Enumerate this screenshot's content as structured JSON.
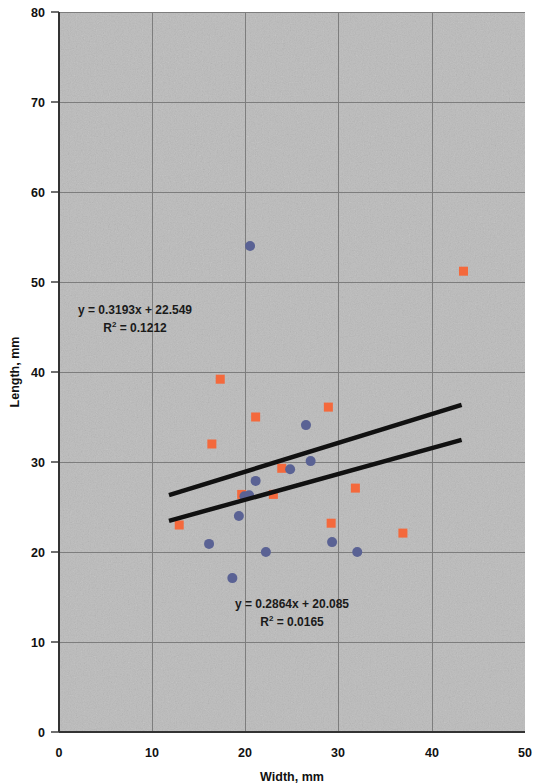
{
  "chart_data": {
    "type": "scatter",
    "title": "",
    "xlabel": "Width, mm",
    "ylabel": "Length, mm",
    "xlim": [
      0,
      50
    ],
    "ylim": [
      0,
      80
    ],
    "xticks": [
      0,
      10,
      20,
      30,
      40,
      50
    ],
    "yticks": [
      0,
      10,
      20,
      30,
      40,
      50,
      60,
      70,
      80
    ],
    "grid": true,
    "legend": "none",
    "plot_background": "#c9c9c9",
    "series": [
      {
        "name": "series-orange-squares",
        "marker": "square",
        "color": "#f4693c",
        "points": [
          {
            "x": 12.9,
            "y": 23.0
          },
          {
            "x": 16.4,
            "y": 32.0
          },
          {
            "x": 17.3,
            "y": 39.2
          },
          {
            "x": 19.6,
            "y": 26.4
          },
          {
            "x": 21.1,
            "y": 35.0
          },
          {
            "x": 23.0,
            "y": 26.4
          },
          {
            "x": 23.9,
            "y": 29.3
          },
          {
            "x": 28.9,
            "y": 36.1
          },
          {
            "x": 29.2,
            "y": 23.2
          },
          {
            "x": 31.8,
            "y": 27.1
          },
          {
            "x": 36.9,
            "y": 22.1
          },
          {
            "x": 43.4,
            "y": 51.2
          }
        ]
      },
      {
        "name": "series-blue-circles",
        "marker": "circle",
        "color": "#5a6294",
        "points": [
          {
            "x": 16.1,
            "y": 20.9
          },
          {
            "x": 18.6,
            "y": 17.1
          },
          {
            "x": 19.3,
            "y": 24.0
          },
          {
            "x": 19.9,
            "y": 26.2
          },
          {
            "x": 20.4,
            "y": 26.3
          },
          {
            "x": 20.5,
            "y": 54.0
          },
          {
            "x": 21.1,
            "y": 27.9
          },
          {
            "x": 22.2,
            "y": 20.0
          },
          {
            "x": 24.8,
            "y": 29.2
          },
          {
            "x": 26.5,
            "y": 34.1
          },
          {
            "x": 27.0,
            "y": 30.1
          },
          {
            "x": 29.3,
            "y": 21.1
          },
          {
            "x": 32.0,
            "y": 20.0
          }
        ]
      }
    ],
    "trendlines": [
      {
        "name": "upper-trendline",
        "slope": 0.3193,
        "intercept": 22.549,
        "r_squared": 0.1212,
        "x_start": 11.8,
        "x_end": 43.2,
        "color": "#111111",
        "equation_text": "y = 0.3193x + 22.549",
        "r2_prefix": "R",
        "r2_exponent": "2",
        "r2_value": " = 0.1212"
      },
      {
        "name": "lower-trendline",
        "slope": 0.2864,
        "intercept": 20.085,
        "r_squared": 0.0165,
        "x_start": 11.8,
        "x_end": 43.2,
        "color": "#111111",
        "equation_text": "y = 0.2864x + 20.085",
        "r2_prefix": "R",
        "r2_exponent": "2",
        "r2_value": " = 0.0165"
      }
    ],
    "annotations": [
      {
        "name": "upper-equation-annotation",
        "line1": "y = 0.3193x + 22.549",
        "line2_prefix": "R",
        "line2_sup": "2",
        "line2_rest": " = 0.1212",
        "x_px": 135,
        "y_px": 314
      },
      {
        "name": "lower-equation-annotation",
        "line1": "y = 0.2864x + 20.085",
        "line2_prefix": "R",
        "line2_sup": "2",
        "line2_rest": " = 0.0165",
        "x_px": 292,
        "y_px": 608
      }
    ]
  },
  "axes": {
    "x_tick_labels": [
      "0",
      "10",
      "20",
      "30",
      "40",
      "50"
    ],
    "y_tick_labels": [
      "0",
      "10",
      "20",
      "30",
      "40",
      "50",
      "60",
      "70",
      "80"
    ],
    "x_title": "Width, mm",
    "y_title": "Length, mm"
  }
}
